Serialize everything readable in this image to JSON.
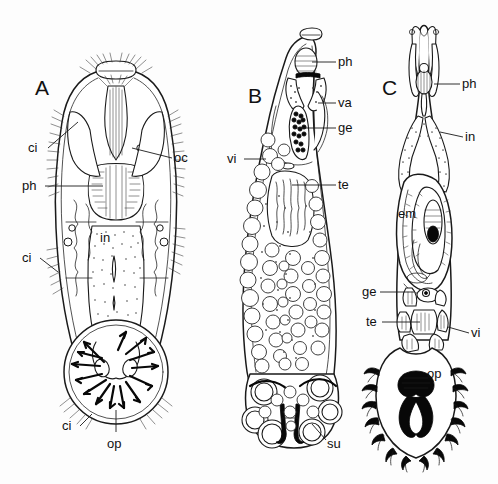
{
  "figure": {
    "background_color": "#fdfdfd",
    "ink_color": "#1a1a1a",
    "width": 498,
    "height": 484
  },
  "panels": [
    {
      "id": "A",
      "letter": "A",
      "letter_x": 35,
      "letter_y": 95,
      "description": "Whole mount, anterior end with oral sucker, ciliated tufts, paired eyespots, pharynx, intestine and posterior opisthaptor bearing radiating arrows",
      "annotations": [
        {
          "key": "ci_upper",
          "text": "ci",
          "x": 28,
          "y": 152,
          "lead_from_x": 48,
          "lead_from_y": 148,
          "lead_to_x": 78,
          "lead_to_y": 122,
          "side": "left"
        },
        {
          "key": "ph",
          "text": "ph",
          "x": 22,
          "y": 190,
          "lead_from_x": 45,
          "lead_from_y": 186,
          "lead_to_x": 103,
          "lead_to_y": 186,
          "side": "left"
        },
        {
          "key": "oc",
          "text": "oc",
          "x": 174,
          "y": 162,
          "lead_from_x": 172,
          "lead_from_y": 158,
          "lead_to_x": 132,
          "lead_to_y": 148,
          "side": "right"
        },
        {
          "key": "in",
          "text": "in",
          "x": 100,
          "y": 242,
          "lead_from_x": 0,
          "lead_from_y": 0,
          "lead_to_x": 0,
          "lead_to_y": 0,
          "side": "none"
        },
        {
          "key": "ci_lower",
          "text": "ci",
          "x": 22,
          "y": 262,
          "lead_from_x": 40,
          "lead_from_y": 258,
          "lead_to_x": 58,
          "lead_to_y": 272,
          "side": "left"
        },
        {
          "key": "ci_bottom",
          "text": "ci",
          "x": 62,
          "y": 430,
          "lead_from_x": 80,
          "lead_from_y": 426,
          "lead_to_x": 92,
          "lead_to_y": 414,
          "side": "left"
        },
        {
          "key": "op",
          "text": "op",
          "x": 107,
          "y": 448,
          "lead_from_x": 116,
          "lead_from_y": 432,
          "lead_to_x": 116,
          "lead_to_y": 410,
          "side": "bottom"
        }
      ]
    },
    {
      "id": "B",
      "letter": "B",
      "letter_x": 248,
      "letter_y": 103,
      "description": "Elongate body with pharynx, vagina, germarium, vitellaria, testis and posterior haptor with paired suckers and clamps",
      "annotations": [
        {
          "key": "ph",
          "text": "ph",
          "x": 338,
          "y": 66,
          "lead_from_x": 336,
          "lead_from_y": 62,
          "lead_to_x": 312,
          "lead_to_y": 62,
          "side": "right"
        },
        {
          "key": "va",
          "text": "va",
          "x": 338,
          "y": 107,
          "lead_from_x": 336,
          "lead_from_y": 103,
          "lead_to_x": 318,
          "lead_to_y": 103,
          "side": "right"
        },
        {
          "key": "ge",
          "text": "ge",
          "x": 338,
          "y": 132,
          "lead_from_x": 336,
          "lead_from_y": 128,
          "lead_to_x": 295,
          "lead_to_y": 128,
          "side": "right"
        },
        {
          "key": "vi",
          "text": "vi",
          "x": 227,
          "y": 163,
          "lead_from_x": 244,
          "lead_from_y": 159,
          "lead_to_x": 266,
          "lead_to_y": 159,
          "side": "left"
        },
        {
          "key": "te",
          "text": "te",
          "x": 338,
          "y": 189,
          "lead_from_x": 336,
          "lead_from_y": 185,
          "lead_to_x": 292,
          "lead_to_y": 185,
          "side": "right"
        },
        {
          "key": "su",
          "text": "su",
          "x": 327,
          "y": 448,
          "lead_from_x": 326,
          "lead_from_y": 440,
          "lead_to_x": 312,
          "lead_to_y": 424,
          "side": "right"
        }
      ]
    },
    {
      "id": "C",
      "letter": "C",
      "letter_x": 382,
      "letter_y": 95,
      "description": "Specimen with bifurcate anterior, pharynx, intestinal caeca, large embryo, germarium, testis, vitellaria and armed opisthaptor with marginal hooks",
      "annotations": [
        {
          "key": "ph",
          "text": "ph",
          "x": 462,
          "y": 88,
          "lead_from_x": 460,
          "lead_from_y": 84,
          "lead_to_x": 434,
          "lead_to_y": 84,
          "side": "right"
        },
        {
          "key": "in",
          "text": "in",
          "x": 465,
          "y": 141,
          "lead_from_x": 463,
          "lead_from_y": 137,
          "lead_to_x": 440,
          "lead_to_y": 132,
          "side": "right"
        },
        {
          "key": "em",
          "text": "em",
          "x": 398,
          "y": 218,
          "lead_from_x": 0,
          "lead_from_y": 0,
          "lead_to_x": 0,
          "lead_to_y": 0,
          "side": "none"
        },
        {
          "key": "ge",
          "text": "ge",
          "x": 362,
          "y": 296,
          "lead_from_x": 380,
          "lead_from_y": 292,
          "lead_to_x": 414,
          "lead_to_y": 292,
          "side": "left"
        },
        {
          "key": "te",
          "text": "te",
          "x": 366,
          "y": 326,
          "lead_from_x": 382,
          "lead_from_y": 322,
          "lead_to_x": 420,
          "lead_to_y": 322,
          "side": "left"
        },
        {
          "key": "vi",
          "text": "vi",
          "x": 471,
          "y": 337,
          "lead_from_x": 469,
          "lead_from_y": 333,
          "lead_to_x": 448,
          "lead_to_y": 327,
          "side": "right"
        },
        {
          "key": "op",
          "text": "op",
          "x": 427,
          "y": 378,
          "lead_from_x": 0,
          "lead_from_y": 0,
          "lead_to_x": 0,
          "lead_to_y": 0,
          "side": "none"
        }
      ]
    }
  ],
  "legend_keys": [
    {
      "abbr": "ci",
      "meaning": "cilia"
    },
    {
      "abbr": "ph",
      "meaning": "pharynx"
    },
    {
      "abbr": "oc",
      "meaning": "ocellus"
    },
    {
      "abbr": "in",
      "meaning": "intestine"
    },
    {
      "abbr": "op",
      "meaning": "opisthaptor"
    },
    {
      "abbr": "va",
      "meaning": "vagina"
    },
    {
      "abbr": "ge",
      "meaning": "germarium"
    },
    {
      "abbr": "vi",
      "meaning": "vitellarium"
    },
    {
      "abbr": "te",
      "meaning": "testis"
    },
    {
      "abbr": "su",
      "meaning": "sucker"
    },
    {
      "abbr": "em",
      "meaning": "embryo"
    }
  ]
}
